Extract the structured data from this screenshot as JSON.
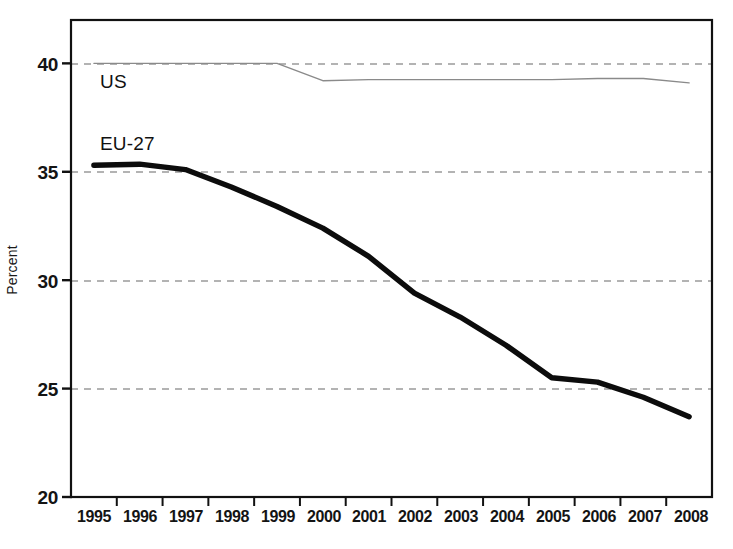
{
  "chart_data": {
    "type": "line",
    "title": "",
    "subtitle": "",
    "xlabel": "",
    "ylabel": "Percent",
    "xlim": [
      1994.5,
      2008.5
    ],
    "ylim": [
      20,
      42
    ],
    "grid": "horizontal-dashed",
    "legend_position": "inline-annotation",
    "categories": [
      1995,
      1996,
      1997,
      1998,
      1999,
      2000,
      2001,
      2002,
      2003,
      2004,
      2005,
      2006,
      2007,
      2008
    ],
    "x_tick_labels": [
      "1995",
      "1996",
      "1997",
      "1998",
      "1999",
      "2000",
      "2001",
      "2002",
      "2003",
      "2004",
      "2005",
      "2006",
      "2007",
      "2008"
    ],
    "y_tick_labels": [
      "20",
      "25",
      "30",
      "35",
      "40"
    ],
    "y_ticks": [
      20,
      25,
      30,
      35,
      40
    ],
    "series": [
      {
        "name": "US",
        "label": "US",
        "color": "#8a8a8a",
        "line_width": 1.4,
        "values": [
          40.0,
          40.0,
          40.0,
          40.0,
          40.0,
          39.2,
          39.25,
          39.25,
          39.25,
          39.25,
          39.25,
          39.3,
          39.3,
          39.1
        ]
      },
      {
        "name": "EU-27",
        "label": "EU-27",
        "color": "#0c0c0c",
        "line_width": 5.4,
        "values": [
          35.3,
          35.35,
          35.1,
          34.3,
          33.4,
          32.4,
          31.1,
          29.4,
          28.3,
          27.0,
          25.5,
          25.3,
          24.6,
          23.7
        ]
      }
    ],
    "annotations": [
      {
        "text": "US",
        "series": "US",
        "x": 1995.6,
        "y": 39.1
      },
      {
        "text": "EU-27",
        "series": "EU-27",
        "x": 1995.5,
        "y": 36.4
      }
    ]
  },
  "axes": {
    "ylabel": "Percent"
  },
  "colors": {
    "grid": "#9a9a9a",
    "frame": "#111111",
    "us_line": "#8a8a8a",
    "eu_line": "#0c0c0c",
    "background": "#ffffff"
  }
}
